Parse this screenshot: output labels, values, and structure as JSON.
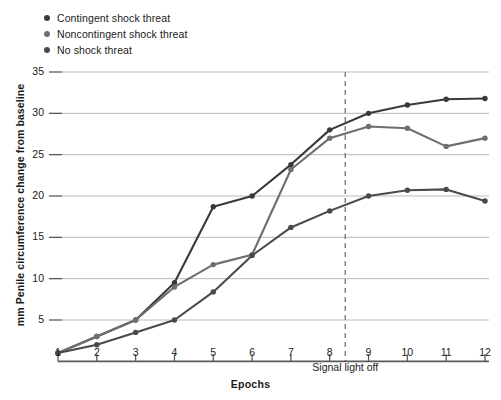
{
  "chart_data": {
    "type": "line",
    "title": "",
    "xlabel": "Epochs",
    "ylabel": "mm Penile circumference change from baseline",
    "x": [
      1,
      2,
      3,
      4,
      5,
      6,
      7,
      8,
      9,
      10,
      11,
      12
    ],
    "xlim": [
      1,
      12
    ],
    "ylim": [
      0,
      36
    ],
    "yticks": [
      5,
      10,
      15,
      20,
      25,
      30,
      35
    ],
    "xticks": [
      1,
      2,
      3,
      4,
      5,
      6,
      7,
      8,
      9,
      10,
      11,
      12
    ],
    "grid": "horizontal",
    "legend_position": "top-left",
    "series": [
      {
        "name": "Contingent shock threat",
        "color": "#3a3a3a",
        "values": [
          1.0,
          3.0,
          5.0,
          9.5,
          18.7,
          20.0,
          23.8,
          28.0,
          30.0,
          31.0,
          31.7,
          31.8
        ]
      },
      {
        "name": "Noncontingent shock threat",
        "color": "#6e6e6e",
        "values": [
          1.0,
          3.0,
          5.0,
          9.0,
          11.7,
          12.9,
          23.2,
          27.0,
          28.4,
          28.2,
          26.0,
          27.0
        ]
      },
      {
        "name": "No shock threat",
        "color": "#4a4a4a",
        "values": [
          1.0,
          2.0,
          3.5,
          5.0,
          8.4,
          12.8,
          16.2,
          18.2,
          20.0,
          20.7,
          20.8,
          19.4
        ]
      }
    ],
    "annotations": [
      {
        "text": "Signal light off",
        "x": 8.4,
        "style": "dashed-vertical-line"
      }
    ]
  },
  "legend": {
    "items": [
      {
        "label": "Contingent shock threat"
      },
      {
        "label": "Noncontingent shock threat"
      },
      {
        "label": "No shock threat"
      }
    ]
  },
  "axis": {
    "y_title": "mm Penile circumference change from baseline",
    "x_title": "Epochs",
    "y_tick_labels": [
      "35",
      "30",
      "25",
      "20",
      "15",
      "10",
      "5"
    ],
    "x_tick_labels": [
      "1",
      "2",
      "3",
      "4",
      "5",
      "6",
      "7",
      "8",
      "9",
      "10",
      "11",
      "12"
    ]
  },
  "colors": {
    "series1": "#3a3a3a",
    "series2": "#6e6e6e",
    "series3": "#4a4a4a",
    "grid": "#b9b9b9",
    "axis": "#5a5a5a",
    "dashed": "#7d7d7d"
  }
}
